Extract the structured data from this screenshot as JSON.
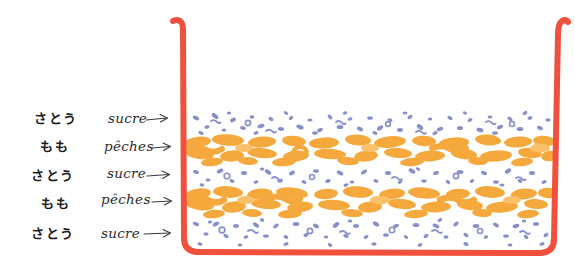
{
  "illustration": {
    "title": "Layered peach and sugar preserve jar",
    "background_color": "#ffffff"
  },
  "jar": {
    "name": "preserving-jar",
    "outline_color": "#F0503C",
    "outline_width": 6,
    "left_wall_x": 181,
    "right_wall_x": 557,
    "top_y": 18,
    "bottom_y": 256
  },
  "palette": {
    "jar_red": "#F0503C",
    "peach_orange": "#F5A83C",
    "peach_orange_light": "#FBC06A",
    "sugar_blue": "#8890C8",
    "sugar_blue_light": "#A8AEDA",
    "ink_black": "#1b1b1b",
    "ink_grey": "#3a3a3a"
  },
  "labels": [
    {
      "id": "row-1",
      "japanese": "さとう",
      "french": "sucre",
      "arrow": "arrow-right",
      "y": 118,
      "ingredient": "sugar"
    },
    {
      "id": "row-2",
      "japanese": "もも",
      "french": "pêches",
      "arrow": "arrow-right",
      "y": 146,
      "ingredient": "peaches"
    },
    {
      "id": "row-3",
      "japanese": "さとう",
      "french": "sucre",
      "arrow": "arrow-right",
      "y": 175,
      "ingredient": "sugar"
    },
    {
      "id": "row-4",
      "japanese": "もも",
      "french": "pêches",
      "arrow": "arrow-right",
      "y": 202,
      "ingredient": "peaches"
    },
    {
      "id": "row-5",
      "japanese": "さとう",
      "french": "sucre",
      "arrow": "arrow-right",
      "y": 233,
      "ingredient": "sugar"
    }
  ],
  "layers": [
    {
      "id": "layer-1",
      "ingredient": "sugar",
      "fill": "speckles",
      "color": "#8890C8",
      "top": 112,
      "bottom": 136
    },
    {
      "id": "layer-2",
      "ingredient": "peaches",
      "fill": "blobs",
      "color": "#F5A83C",
      "top": 136,
      "bottom": 166
    },
    {
      "id": "layer-3",
      "ingredient": "sugar",
      "fill": "speckles",
      "color": "#8890C8",
      "top": 166,
      "bottom": 188
    },
    {
      "id": "layer-4",
      "ingredient": "peaches",
      "fill": "blobs",
      "color": "#F5A83C",
      "top": 188,
      "bottom": 218
    },
    {
      "id": "layer-5",
      "ingredient": "sugar",
      "fill": "speckles",
      "color": "#8890C8",
      "top": 218,
      "bottom": 250
    }
  ]
}
